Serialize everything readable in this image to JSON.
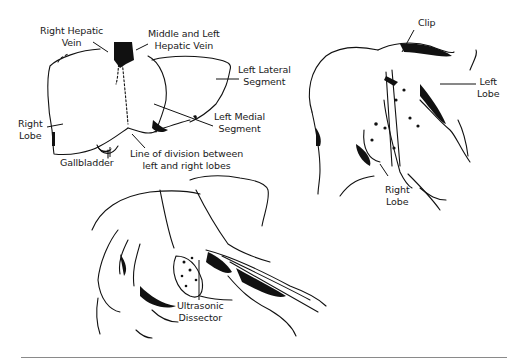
{
  "figure": {
    "panels": [
      {
        "id": "panel-a",
        "subject": "liver anatomy anterior view",
        "labels": [
          {
            "key": "right_hepatic_vein",
            "text": "Right Hepatic\nVein"
          },
          {
            "key": "middle_left_hepatic_vein",
            "text": "Middle and Left\nHepatic Vein"
          },
          {
            "key": "left_lateral_segment",
            "text": "Left Lateral\nSegment"
          },
          {
            "key": "left_medial_segment",
            "text": "Left Medial\nSegment"
          },
          {
            "key": "right_lobe",
            "text": "Right\nLobe"
          },
          {
            "key": "gallbladder",
            "text": "Gallbladder"
          },
          {
            "key": "line_of_division",
            "text": "Line of division between\nleft and right lobes"
          }
        ]
      },
      {
        "id": "panel-b",
        "subject": "liver lobes separated with clip",
        "labels": [
          {
            "key": "clip",
            "text": "Clip"
          },
          {
            "key": "left_lobe",
            "text": "Left\nLobe"
          },
          {
            "key": "right_lobe",
            "text": "Right\nLobe"
          }
        ]
      },
      {
        "id": "panel-c",
        "subject": "hands retracting liver with instrument",
        "labels": [
          {
            "key": "ultrasonic_dissector",
            "text": "Ultrasonic\nDissector"
          }
        ]
      }
    ]
  },
  "labels": {
    "right_hepatic_vein": "Right Hepatic\nVein",
    "middle_left_hepatic_vein": "Middle and Left\nHepatic Vein",
    "left_lateral_segment": "Left Lateral\nSegment",
    "left_medial_segment": "Left Medial\nSegment",
    "right_lobe_a": "Right\nLobe",
    "gallbladder": "Gallbladder",
    "line_of_division": "Line of division between\nleft and right lobes",
    "clip": "Clip",
    "left_lobe": "Left\nLobe",
    "right_lobe_b": "Right\nLobe",
    "ultrasonic_dissector": "Ultrasonic\nDissector"
  },
  "colors": {
    "ink": "#111111",
    "background": "#ffffff",
    "rule": "#8a8a8a"
  }
}
